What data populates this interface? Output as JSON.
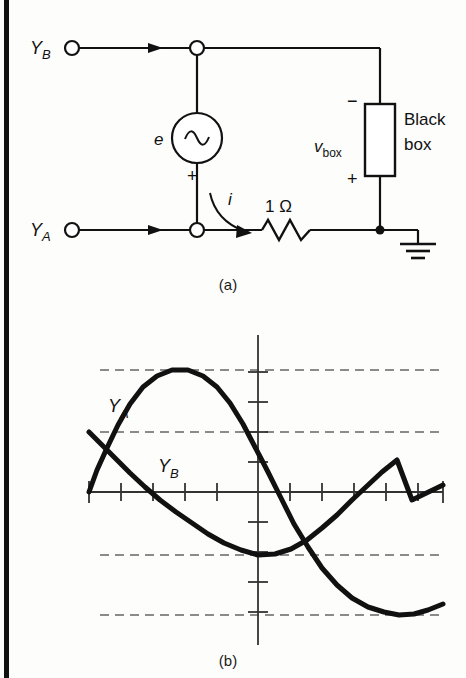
{
  "figure": {
    "caption_a": "(a)",
    "caption_b": "(b)"
  },
  "circuit": {
    "terminal_top_label": "Y",
    "terminal_top_sub": "B",
    "terminal_bottom_label": "Y",
    "terminal_bottom_sub": "A",
    "source_label": "e",
    "source_symbol": "~",
    "source_polarity_plus": "+",
    "current_label": "i",
    "resistor_label": "1 Ω",
    "box_voltage_label": "v",
    "box_voltage_sub": "box",
    "box_polarity_minus": "−",
    "box_polarity_plus": "+",
    "black_box_line1": "Black",
    "black_box_line2": "box",
    "ground_name": "ground-symbol",
    "ink_color": "#111111"
  },
  "chart_data": {
    "type": "line",
    "title": "",
    "xlabel": "",
    "ylabel": "",
    "grid": true,
    "legend": "inline-curve-labels",
    "axis": {
      "x_axis_y_pixel": 492,
      "y_axis_x_pixel": 258,
      "x_tick_spacing_px": 32,
      "y_tick_spacing_px": 30,
      "x_ticks": [
        89,
        121,
        153,
        185,
        217,
        258,
        290,
        322,
        354,
        386,
        418,
        443
      ],
      "y_ticks": [
        372,
        402,
        432,
        462,
        522,
        552,
        582,
        612
      ]
    },
    "dashed_gridlines_y": [
      370,
      432,
      555,
      615
    ],
    "series": [
      {
        "name": "Y",
        "sub": "A",
        "label": "Y_A",
        "label_x": 108,
        "label_y": 405,
        "description": "sine starting at zero axis on left, rising to peak near +1, falling through axis, reaching trough near -1 at right then rising",
        "amplitude_px": 123,
        "period_px": 330,
        "phase_deg": 0,
        "color": "#111111",
        "points": [
          [
            89,
            492
          ],
          [
            97,
            470
          ],
          [
            107,
            448
          ],
          [
            118,
            425
          ],
          [
            130,
            404
          ],
          [
            143,
            387
          ],
          [
            157,
            376
          ],
          [
            172,
            370
          ],
          [
            188,
            370
          ],
          [
            203,
            376
          ],
          [
            217,
            387
          ],
          [
            230,
            403
          ],
          [
            243,
            424
          ],
          [
            255,
            447
          ],
          [
            268,
            472
          ],
          [
            281,
            498
          ],
          [
            294,
            524
          ],
          [
            308,
            547
          ],
          [
            322,
            568
          ],
          [
            337,
            585
          ],
          [
            352,
            598
          ],
          [
            368,
            607
          ],
          [
            384,
            612
          ],
          [
            399,
            615
          ],
          [
            414,
            614
          ],
          [
            428,
            610
          ],
          [
            443,
            604
          ]
        ]
      },
      {
        "name": "Y",
        "sub": "B",
        "label": "Y_B",
        "label_x": 160,
        "label_y": 468,
        "description": "cosine-like curve starting high on left, descending through axis, trough near bottom dashed line, rising at right",
        "amplitude_px": 123,
        "period_px": 330,
        "phase_deg": -90,
        "color": "#111111",
        "points": [
          [
            89,
            432
          ],
          [
            102,
            445
          ],
          [
            116,
            459
          ],
          [
            130,
            473
          ],
          [
            145,
            487
          ],
          [
            160,
            500
          ],
          [
            176,
            512
          ],
          [
            192,
            523
          ],
          [
            208,
            534
          ],
          [
            224,
            543
          ],
          [
            241,
            550
          ],
          [
            258,
            555
          ],
          [
            275,
            554
          ],
          [
            291,
            549
          ],
          [
            307,
            540
          ],
          [
            322,
            528
          ],
          [
            337,
            515
          ],
          [
            352,
            500
          ],
          [
            367,
            486
          ],
          [
            382,
            472
          ],
          [
            397,
            460
          ],
          [
            412,
            500
          ],
          [
            443,
            485
          ]
        ]
      }
    ]
  }
}
